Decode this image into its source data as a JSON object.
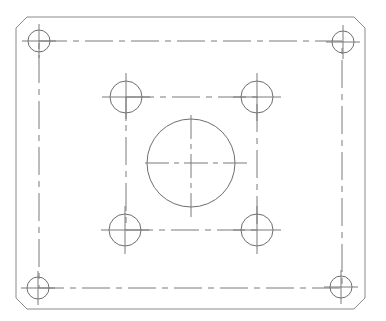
{
  "drawing": {
    "title": "Mounting plate – top view",
    "colors": {
      "background": "#ffffff",
      "outline": "#8a8a8a",
      "holes": "#6e6e6e",
      "centerlines": "#7a7a7a"
    },
    "plate": {
      "left": 16,
      "top": 17,
      "right": 365,
      "bottom": 309,
      "chamfer": 11
    },
    "outer_bolt_pattern": {
      "rect": {
        "left": 39,
        "top": 41,
        "right": 342,
        "bottom": 288
      },
      "hole_radius": 11,
      "holes": [
        {
          "name": "top-left",
          "cx": 39,
          "cy": 41
        },
        {
          "name": "top-right",
          "cx": 343,
          "cy": 42
        },
        {
          "name": "bottom-left",
          "cx": 38,
          "cy": 288
        },
        {
          "name": "bottom-right",
          "cx": 341,
          "cy": 287
        }
      ]
    },
    "inner_bolt_pattern": {
      "rect": {
        "left": 126,
        "top": 97,
        "right": 257,
        "bottom": 230
      },
      "hole_radius": 16,
      "holes": [
        {
          "name": "top-left",
          "cx": 126,
          "cy": 97
        },
        {
          "name": "top-right",
          "cx": 257,
          "cy": 97
        },
        {
          "name": "bottom-left",
          "cx": 125,
          "cy": 230
        },
        {
          "name": "bottom-right",
          "cx": 257,
          "cy": 230
        }
      ]
    },
    "center_bore": {
      "cx": 191,
      "cy": 163,
      "r": 44
    }
  }
}
